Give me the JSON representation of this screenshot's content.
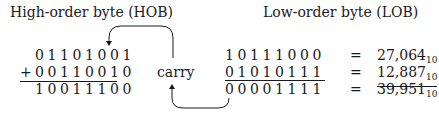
{
  "headers": {
    "hob": "High-order byte (HOB)",
    "lob": "Low-order byte (LOB)"
  },
  "hob": {
    "row1": "01101001",
    "plus": "+",
    "row2": "00110010",
    "result": "10011100"
  },
  "carry_label": "carry",
  "lob": {
    "row1": "10111000",
    "row2": "01010111",
    "result": "00001111"
  },
  "equals": [
    "=",
    "=",
    "="
  ],
  "decimal": [
    {
      "value": "27,064",
      "base": "10"
    },
    {
      "value": "12,887",
      "base": "10"
    },
    {
      "value": "39,951",
      "base": "10"
    }
  ],
  "colors": {
    "ink": "#1a1a1a",
    "background": "#ffffff"
  }
}
